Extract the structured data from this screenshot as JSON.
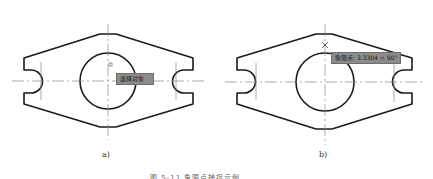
{
  "figure_a": {
    "label": "a)",
    "tooltip": "选择对象",
    "marker": "□"
  },
  "figure_b": {
    "label": "b)",
    "tooltip": "象限点: 3.3304 < 90°",
    "marker": "×"
  },
  "figure_caption": "图 5-11 象限点捕捉示例",
  "colors": {
    "outline": "#1a1a1a",
    "centerline": "#888888",
    "tooltip_bg": "#8c8c8c"
  }
}
